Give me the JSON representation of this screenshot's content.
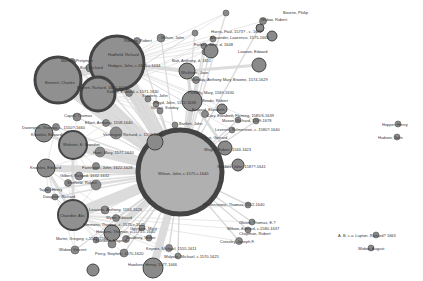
{
  "diagram": {
    "type": "network-graph",
    "colors": {
      "background": "#ffffff",
      "node_fill": "#a0a0a0",
      "node_fill_large": "#b0b0b0",
      "node_stroke": "#444444",
      "edge": "#d6d6d6",
      "label": "#333333"
    },
    "nodes": [
      {
        "id": "wilson",
        "label": "Wilson, John, c.1575-c.1640",
        "x": 180,
        "y": 172,
        "r": 42,
        "stroke": 5
      },
      {
        "id": "hodges",
        "label": "Hodges, John, c.1605-c.1634",
        "x": 117,
        "y": 63,
        "r": 27,
        "stroke": 3
      },
      {
        "id": "bennett",
        "label": "Bennett, Charles",
        "x": 58,
        "y": 80,
        "r": 23,
        "stroke": 3
      },
      {
        "id": "everett",
        "label": "Everett, Richard",
        "x": 98,
        "y": 94,
        "r": 17,
        "stroke": 3
      },
      {
        "id": "webster",
        "label": "Webster, E. Brandon",
        "x": 73,
        "y": 145,
        "r": 14,
        "stroke": 2
      },
      {
        "id": "chandler",
        "label": "Chandler, Alis",
        "x": 73,
        "y": 215,
        "r": 15,
        "stroke": 2
      },
      {
        "id": "knowles",
        "label": "Knowles, Edward",
        "x": 46,
        "y": 168,
        "r": 9,
        "stroke": 1
      },
      {
        "id": "knowles2",
        "label": "Knowles, Edward",
        "x": 44,
        "y": 133,
        "r": 9,
        "stroke": 1
      },
      {
        "id": "hawkins",
        "label": "Hawkins, Henry, 1577-1646",
        "x": 153,
        "y": 268,
        "r": 10,
        "stroke": 1
      },
      {
        "id": "johnson",
        "label": "Johnson, Thomas, 1570-1645",
        "x": 112,
        "y": 233,
        "r": 8,
        "stroke": 1
      },
      {
        "id": "waterman",
        "label": "Waterman, Jacob",
        "x": 93,
        "y": 270,
        "r": 6,
        "stroke": 1
      },
      {
        "id": "batt",
        "label": "Batt, Anthony, d. 1651",
        "x": 187,
        "y": 71,
        "r": 8,
        "stroke": 1
      },
      {
        "id": "kirkman",
        "label": "Kirkman, Edward",
        "x": 211,
        "y": 51,
        "r": 7,
        "stroke": 1
      },
      {
        "id": "watson",
        "label": "Watson, Robert",
        "x": 192,
        "y": 101,
        "r": 10,
        "stroke": 1
      },
      {
        "id": "knowles3",
        "label": "Knowles, Robert",
        "x": 155,
        "y": 142,
        "r": 8,
        "stroke": 1
      },
      {
        "id": "wright",
        "label": "Wright, Robert, 1563-1623",
        "x": 225,
        "y": 148,
        "r": 7,
        "stroke": 1
      },
      {
        "id": "stockes",
        "label": "Stockes, John, 1587?-1641",
        "x": 238,
        "y": 165,
        "r": 6,
        "stroke": 1
      },
      {
        "id": "bondo",
        "label": "Bondo, Robert",
        "x": 222,
        "y": 109,
        "r": 5,
        "stroke": 1
      },
      {
        "id": "warton",
        "label": "Warton, Robert",
        "x": 259,
        "y": 65,
        "r": 7,
        "stroke": 1
      },
      {
        "id": "bolton",
        "label": "Bolton, Robert",
        "x": 260,
        "y": 28,
        "r": 4,
        "stroke": 1
      },
      {
        "id": "jonson",
        "label": "Jonson, Ben",
        "x": 272,
        "y": 36,
        "r": 5,
        "stroke": 1
      }
    ],
    "labels": [
      {
        "text": "Bourne, Philip",
        "x": 283,
        "y": 13
      },
      {
        "text": "Widow, Robert",
        "x": 261,
        "y": 20
      },
      {
        "text": "Harris, Paul, 1573? - c. 1642",
        "x": 211,
        "y": 32
      },
      {
        "text": "Alexander, Lawrence, 1575-1663",
        "x": 210,
        "y": 38
      },
      {
        "text": "Wilson, John",
        "x": 161,
        "y": 38
      },
      {
        "text": "Rookes, Robert",
        "x": 124,
        "y": 41
      },
      {
        "text": "Forbes, John, d. 1648",
        "x": 194,
        "y": 45
      },
      {
        "text": "Hadfield, Richard",
        "x": 108,
        "y": 55
      },
      {
        "text": "Lawson, Edward",
        "x": 238,
        "y": 52
      },
      {
        "text": "Batt, Anthony, d. 1651",
        "x": 172,
        "y": 61
      },
      {
        "text": "Hodges, John, c.1605-c.1634",
        "x": 108,
        "y": 66
      },
      {
        "text": "Martha, Pretyman",
        "x": 61,
        "y": 61
      },
      {
        "text": "Bull, Richard",
        "x": 80,
        "y": 68
      },
      {
        "text": "Bennett, Charles",
        "x": 45,
        "y": 83
      },
      {
        "text": "Wickham, Joan",
        "x": 181,
        "y": 73
      },
      {
        "text": "Munday, Anthony Mary Browne, 1574-1629",
        "x": 191,
        "y": 80
      },
      {
        "text": "Everett, Richard, 1600-1653",
        "x": 77,
        "y": 88
      },
      {
        "text": "Kidder, Edward, c.1571-1630",
        "x": 107,
        "y": 92
      },
      {
        "text": "Pickerly, Mary, 1569-1630",
        "x": 188,
        "y": 93
      },
      {
        "text": "Sanders, John",
        "x": 142,
        "y": 96
      },
      {
        "text": "Floyd, John, 1572-1648",
        "x": 154,
        "y": 103
      },
      {
        "text": "Gilbert, Sunday",
        "x": 151,
        "y": 108
      },
      {
        "text": "Bondo, Robert",
        "x": 202,
        "y": 101
      },
      {
        "text": "Everard, Elizabeth",
        "x": 192,
        "y": 110
      },
      {
        "text": "Cary, Elizabeth Fleming, 1585/6-1639",
        "x": 207,
        "y": 116
      },
      {
        "text": "Mason, Richard, 1599-1678",
        "x": 222,
        "y": 121
      },
      {
        "text": "Capell, Thomas",
        "x": 64,
        "y": 116
      },
      {
        "text": "Elliott, Anthony, 1558-1640",
        "x": 85,
        "y": 123
      },
      {
        "text": "Bartlett, John",
        "x": 179,
        "y": 124
      },
      {
        "text": "Leverett, Pulmerston, c. 1580?-1640",
        "x": 215,
        "y": 130
      },
      {
        "text": "Davenport, Thomas, c. 1550?-1660",
        "x": 22,
        "y": 128
      },
      {
        "text": "Knowles, Edward",
        "x": 31,
        "y": 135
      },
      {
        "text": "Verstegan, Richard, c. 1550-1640",
        "x": 103,
        "y": 135
      },
      {
        "text": "Pryce, Gerrard",
        "x": 201,
        "y": 138
      },
      {
        "text": "Webster, E. Brandon",
        "x": 63,
        "y": 145
      },
      {
        "text": "Hunt, Mary, 1577-1640",
        "x": 93,
        "y": 153
      },
      {
        "text": "Wright, Robert, 1563-1623",
        "x": 204,
        "y": 150
      },
      {
        "text": "Stockes, John, 1587?-1641",
        "x": 217,
        "y": 167
      },
      {
        "text": "Knowles, Edward",
        "x": 30,
        "y": 168
      },
      {
        "text": "Farrington, John, 1622-1628",
        "x": 82,
        "y": 168
      },
      {
        "text": "Gilbert, Richard, 1632-1632",
        "x": 60,
        "y": 176
      },
      {
        "text": "Sheffield, Robert",
        "x": 67,
        "y": 183
      },
      {
        "text": "Taylor, Henry",
        "x": 39,
        "y": 190
      },
      {
        "text": "Daughter, Richard",
        "x": 43,
        "y": 197
      },
      {
        "text": "Wilson, John, c.1575-c.1640",
        "x": 158,
        "y": 174
      },
      {
        "text": "Featherstone, Thomas, 1552-1640",
        "x": 203,
        "y": 205
      },
      {
        "text": "Chandler, Alis",
        "x": 60,
        "y": 216
      },
      {
        "text": "Leavens, Anthony, 1554-1626",
        "x": 89,
        "y": 210
      },
      {
        "text": "Wynn, Edward",
        "x": 106,
        "y": 218
      },
      {
        "text": "Glover, Thomas, E.?",
        "x": 239,
        "y": 223
      },
      {
        "text": "Wilson, Edward, c.1580-1637",
        "x": 227,
        "y": 229
      },
      {
        "text": "Simmons, Thomas, c. 1575-c.1645",
        "x": 83,
        "y": 225
      },
      {
        "text": "Martin, Gregory, c.1542-1582",
        "x": 56,
        "y": 239
      },
      {
        "text": "Goodwin, Mary",
        "x": 130,
        "y": 229
      },
      {
        "text": "Chapman, Robert",
        "x": 239,
        "y": 234
      },
      {
        "text": "Hawkins, Thomas, c.1575-c.1640",
        "x": 96,
        "y": 232
      },
      {
        "text": "Bradbury, Walter",
        "x": 126,
        "y": 238
      },
      {
        "text": "Crossley, Joseph F.",
        "x": 220,
        "y": 242
      },
      {
        "text": "Standish, Roger F.",
        "x": 95,
        "y": 241
      },
      {
        "text": "Keynes, Michael, 1555-1611",
        "x": 146,
        "y": 249
      },
      {
        "text": "Widow, Vincent",
        "x": 59,
        "y": 250
      },
      {
        "text": "Percy, Stephen, 1570-1620",
        "x": 95,
        "y": 254
      },
      {
        "text": "Walpole, Michael, c.1570-1625",
        "x": 164,
        "y": 257
      },
      {
        "text": "Hawkins, Henry, 1577-1646",
        "x": 128,
        "y": 265
      },
      {
        "text": "Hopper, Henry",
        "x": 382,
        "y": 125
      },
      {
        "text": "Hudson, John",
        "x": 378,
        "y": 138
      },
      {
        "text": "A. B. c.u. Lupton, Richard? 1663",
        "x": 338,
        "y": 236
      },
      {
        "text": "Widow, August",
        "x": 358,
        "y": 249
      }
    ],
    "small_nodes": [
      {
        "x": 226,
        "y": 13,
        "r": 3
      },
      {
        "x": 263,
        "y": 21,
        "r": 3.5
      },
      {
        "x": 195,
        "y": 33,
        "r": 3
      },
      {
        "x": 213,
        "y": 39,
        "r": 3
      },
      {
        "x": 137,
        "y": 41,
        "r": 3.5
      },
      {
        "x": 161,
        "y": 38,
        "r": 4
      },
      {
        "x": 204,
        "y": 46,
        "r": 3
      },
      {
        "x": 205,
        "y": 52,
        "r": 3
      },
      {
        "x": 113,
        "y": 55,
        "r": 3.5
      },
      {
        "x": 72,
        "y": 62,
        "r": 3.5
      },
      {
        "x": 90,
        "y": 68,
        "r": 4
      },
      {
        "x": 107,
        "y": 72,
        "r": 4
      },
      {
        "x": 196,
        "y": 80,
        "r": 3.5
      },
      {
        "x": 129,
        "y": 93,
        "r": 3.5
      },
      {
        "x": 196,
        "y": 94,
        "r": 3
      },
      {
        "x": 148,
        "y": 99,
        "r": 3
      },
      {
        "x": 156,
        "y": 104,
        "r": 3
      },
      {
        "x": 160,
        "y": 111,
        "r": 3
      },
      {
        "x": 205,
        "y": 114,
        "r": 3.5
      },
      {
        "x": 238,
        "y": 120,
        "r": 3
      },
      {
        "x": 256,
        "y": 121,
        "r": 3
      },
      {
        "x": 77,
        "y": 117,
        "r": 4
      },
      {
        "x": 106,
        "y": 123,
        "r": 3.5
      },
      {
        "x": 175,
        "y": 125,
        "r": 3
      },
      {
        "x": 232,
        "y": 130,
        "r": 3
      },
      {
        "x": 56,
        "y": 127,
        "r": 3.5
      },
      {
        "x": 116,
        "y": 133,
        "r": 6
      },
      {
        "x": 100,
        "y": 152,
        "r": 5
      },
      {
        "x": 96,
        "y": 166,
        "r": 3.5
      },
      {
        "x": 79,
        "y": 176,
        "r": 4
      },
      {
        "x": 68,
        "y": 183,
        "r": 3.5
      },
      {
        "x": 48,
        "y": 190,
        "r": 3
      },
      {
        "x": 55,
        "y": 197,
        "r": 3
      },
      {
        "x": 96,
        "y": 185,
        "r": 5
      },
      {
        "x": 248,
        "y": 205,
        "r": 3
      },
      {
        "x": 105,
        "y": 210,
        "r": 4
      },
      {
        "x": 116,
        "y": 218,
        "r": 3.5
      },
      {
        "x": 252,
        "y": 222,
        "r": 3
      },
      {
        "x": 142,
        "y": 228,
        "r": 3
      },
      {
        "x": 96,
        "y": 240,
        "r": 3
      },
      {
        "x": 126,
        "y": 239,
        "r": 3.5
      },
      {
        "x": 248,
        "y": 230,
        "r": 3
      },
      {
        "x": 239,
        "y": 241,
        "r": 3.5
      },
      {
        "x": 112,
        "y": 244,
        "r": 4
      },
      {
        "x": 149,
        "y": 238,
        "r": 3
      },
      {
        "x": 169,
        "y": 248,
        "r": 3.5
      },
      {
        "x": 75,
        "y": 250,
        "r": 4
      },
      {
        "x": 124,
        "y": 253,
        "r": 4
      },
      {
        "x": 178,
        "y": 256,
        "r": 3
      },
      {
        "x": 398,
        "y": 124,
        "r": 3
      },
      {
        "x": 397,
        "y": 137,
        "r": 3
      },
      {
        "x": 376,
        "y": 235,
        "r": 3
      },
      {
        "x": 371,
        "y": 248,
        "r": 3
      }
    ],
    "edges_heavy": [
      [
        "wilson",
        "hodges",
        14
      ],
      [
        "wilson",
        "bennett",
        12
      ],
      [
        "wilson",
        "everett",
        10
      ],
      [
        "wilson",
        "webster",
        10
      ],
      [
        "wilson",
        "chandler",
        11
      ],
      [
        "wilson",
        "knowles",
        7
      ],
      [
        "wilson",
        "hawkins",
        8
      ],
      [
        "wilson",
        "johnson",
        6
      ],
      [
        "wilson",
        "watson",
        5
      ],
      [
        "wilson",
        "wright",
        4
      ],
      [
        "wilson",
        "stockes",
        3
      ],
      [
        "wilson",
        "knowles3",
        5
      ],
      [
        "bennett",
        "hodges",
        7
      ],
      [
        "bennett",
        "everett",
        5
      ],
      [
        "hodges",
        "batt",
        4
      ],
      [
        "hodges",
        "everett",
        4
      ],
      [
        "webster",
        "knowles2",
        3
      ],
      [
        "webster",
        "chandler",
        3
      ],
      [
        "knowles",
        "chandler",
        3
      ],
      [
        "batt",
        "warton",
        3
      ],
      [
        "watson",
        "wright",
        3
      ],
      [
        "watson",
        "batt",
        3
      ]
    ]
  }
}
